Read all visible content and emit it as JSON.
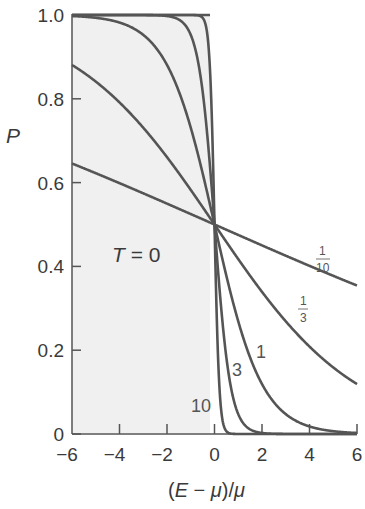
{
  "chart_data": {
    "type": "line",
    "title": "",
    "xlabel": "(E − μ)/μ",
    "ylabel": "P",
    "xlim": [
      -6,
      6
    ],
    "ylim": [
      0,
      1
    ],
    "xticks": [
      -6,
      -4,
      -2,
      0,
      2,
      4,
      6
    ],
    "yticks": [
      0,
      0.2,
      0.4,
      0.6,
      0.8,
      1.0
    ],
    "xtick_labels": [
      "−6",
      "−4",
      "−2",
      "0",
      "2",
      "4",
      "6"
    ],
    "ytick_labels": [
      "0",
      "0.2",
      "0.4",
      "0.6",
      "0.8",
      "1.0"
    ],
    "grid": false,
    "shaded_region": {
      "label": "T = 0",
      "x_from": -6,
      "x_to": 0,
      "P": 1,
      "color": "#f1f1f1"
    },
    "function": "P = 1 / (exp(beta*x) + 1)",
    "series": [
      {
        "name": "10",
        "beta": 10,
        "label": "10"
      },
      {
        "name": "3",
        "beta": 3,
        "label": "3"
      },
      {
        "name": "1",
        "beta": 1,
        "label": "1"
      },
      {
        "name": "1/3",
        "beta": 0.3333,
        "label_num": "1",
        "label_den": "3"
      },
      {
        "name": "1/10",
        "beta": 0.1,
        "label_num": "1",
        "label_den": "10"
      }
    ],
    "annotations": [
      "T = 0",
      "10",
      "3",
      "1",
      "1/3",
      "1/10"
    ],
    "line_color": "#555555"
  },
  "labels": {
    "ylabel": "P",
    "xlabel_pre": "(",
    "xlabel_E": "E",
    "xlabel_mid": " − ",
    "xlabel_mu1": "μ",
    "xlabel_post": ")/",
    "xlabel_mu2": "μ",
    "t0_T": "T",
    "t0_rest": " = 0",
    "curve_10": "10",
    "curve_3": "3",
    "curve_1": "1",
    "third_num": "1",
    "third_den": "3",
    "tenth_num": "1",
    "tenth_den": "10"
  }
}
